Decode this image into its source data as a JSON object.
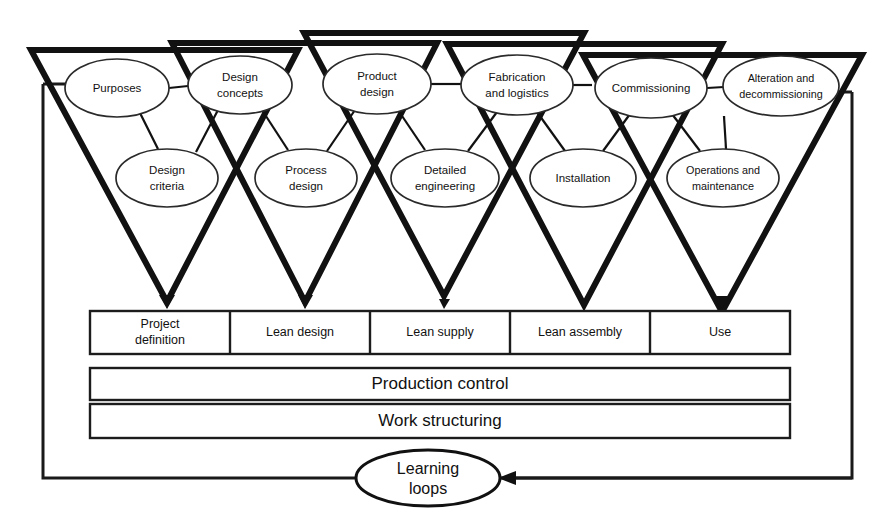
{
  "figure": {
    "type": "process-diagram",
    "title_visible": false,
    "colors": {
      "stroke": "#111111",
      "background": "#ffffff",
      "ellipse_stroke": "#2a2a2a"
    }
  },
  "triangles": [
    {
      "id": "t1",
      "phase": "Project definition"
    },
    {
      "id": "t2",
      "phase": "Lean design"
    },
    {
      "id": "t3",
      "phase": "Lean supply"
    },
    {
      "id": "t4",
      "phase": "Lean assembly"
    },
    {
      "id": "t5",
      "phase": "Use"
    }
  ],
  "nodes_top": [
    {
      "id": "n-purposes",
      "lines": [
        "Purposes"
      ],
      "cx": 117,
      "cy": 88,
      "rx": 52,
      "ry": 29
    },
    {
      "id": "n-design-concepts",
      "lines": [
        "Design",
        "concepts"
      ],
      "cx": 240,
      "cy": 85,
      "rx": 52,
      "ry": 29
    },
    {
      "id": "n-product-design",
      "lines": [
        "Product",
        "design"
      ],
      "cx": 377,
      "cy": 84,
      "rx": 54,
      "ry": 30
    },
    {
      "id": "n-fabrication-logistics",
      "lines": [
        "Fabrication",
        "and logistics"
      ],
      "cx": 517,
      "cy": 85,
      "rx": 56,
      "ry": 30
    },
    {
      "id": "n-commissioning",
      "lines": [
        "Commissioning"
      ],
      "cx": 651,
      "cy": 88,
      "rx": 56,
      "ry": 30
    },
    {
      "id": "n-alteration-decommissioning",
      "lines": [
        "Alteration and",
        "decommissioning"
      ],
      "cx": 781,
      "cy": 86,
      "rx": 58,
      "ry": 30
    }
  ],
  "nodes_bottom": [
    {
      "id": "n-design-criteria",
      "lines": [
        "Design",
        "criteria"
      ],
      "cx": 167,
      "cy": 178,
      "rx": 51,
      "ry": 29
    },
    {
      "id": "n-process-design",
      "lines": [
        "Process",
        "design"
      ],
      "cx": 306,
      "cy": 178,
      "rx": 51,
      "ry": 29
    },
    {
      "id": "n-detailed-engineering",
      "lines": [
        "Detailed",
        "engineering"
      ],
      "cx": 445,
      "cy": 178,
      "rx": 54,
      "ry": 29
    },
    {
      "id": "n-installation",
      "lines": [
        "Installation"
      ],
      "cx": 583,
      "cy": 178,
      "rx": 53,
      "ry": 29
    },
    {
      "id": "n-operations-maintenance",
      "lines": [
        "Operations and",
        "maintenance"
      ],
      "cx": 723,
      "cy": 178,
      "rx": 56,
      "ry": 29
    }
  ],
  "phase_bar": {
    "cells": [
      {
        "id": "phase-project-definition",
        "lines": [
          "Project",
          "definition"
        ]
      },
      {
        "id": "phase-lean-design",
        "lines": [
          "Lean design"
        ]
      },
      {
        "id": "phase-lean-supply",
        "lines": [
          "Lean supply"
        ]
      },
      {
        "id": "phase-lean-assembly",
        "lines": [
          "Lean assembly"
        ]
      },
      {
        "id": "phase-use",
        "lines": [
          "Use"
        ]
      }
    ]
  },
  "bands": [
    {
      "id": "band-production-control",
      "label": "Production control"
    },
    {
      "id": "band-work-structuring",
      "label": "Work structuring"
    }
  ],
  "loop": {
    "id": "learning-loops",
    "lines": [
      "Learning",
      "loops"
    ],
    "arrow_direction": "right-to-left"
  }
}
